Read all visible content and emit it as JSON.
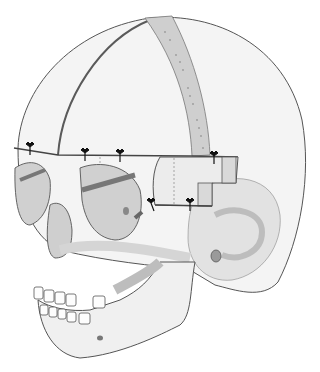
{
  "figure": {
    "colors": {
      "background": "#ffffff",
      "bone_light": "#f2f2f2",
      "bone_mid": "#d6d6d6",
      "bone_dark": "#a8a8a8",
      "outline": "#555555",
      "cut_line": "#4a4a4a",
      "graft_strip": "#c9c9c9",
      "screw": "#111111"
    },
    "screws": [
      {
        "x": 30,
        "y": 147
      },
      {
        "x": 85,
        "y": 153
      },
      {
        "x": 120,
        "y": 154
      },
      {
        "x": 214,
        "y": 156
      },
      {
        "x": 151,
        "y": 203
      },
      {
        "x": 190,
        "y": 203
      }
    ]
  }
}
